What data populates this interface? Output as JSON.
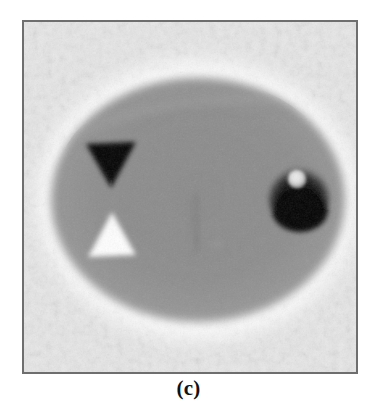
{
  "figure": {
    "caption": "(c)",
    "panel_label": "c",
    "kind": "grayscale-phantom-reconstruction"
  },
  "frame": {
    "border_color": "#6e6e6e",
    "border_width_px": 2,
    "x": 22,
    "y": 20,
    "width": 336,
    "height": 354
  },
  "image_content": {
    "background_label": "noisy-light-background",
    "background_color": "#ececec",
    "background_color_dark": "#d8d8d8",
    "halo_color": "#f7f7f7",
    "body": {
      "name": "ellipse-body",
      "center_x": 174,
      "center_y": 178,
      "radius_x": 147,
      "radius_y": 122,
      "fill_color": "#8c8c8c",
      "edge_color": "#9a9a9a"
    },
    "features": [
      {
        "name": "dark-triangle-down",
        "shape": "triangle",
        "orientation": "down",
        "center_x": 86,
        "center_y": 143,
        "width": 48,
        "height": 43,
        "fill_color": "#0d0d0d",
        "contrast": "dark"
      },
      {
        "name": "white-triangle-up",
        "shape": "triangle",
        "orientation": "up",
        "center_x": 88,
        "center_y": 212,
        "width": 46,
        "height": 42,
        "fill_color": "#fbfbfb",
        "contrast": "bright"
      },
      {
        "name": "dark-disc-lesion",
        "shape": "disc",
        "center_x": 275,
        "center_y": 176,
        "radius": 31,
        "fill_color": "#0a0a0a",
        "contrast": "dark"
      },
      {
        "name": "bright-spot-inclusion",
        "shape": "disc",
        "center_x": 273,
        "center_y": 157,
        "radius": 9,
        "fill_color": "#e6e6e6",
        "contrast": "bright"
      },
      {
        "name": "faint-vertical-streak",
        "shape": "streak",
        "center_x": 173,
        "center_y": 200,
        "width": 5,
        "height": 56,
        "fill_color": "#7e7e7e",
        "contrast": "subtle-dark"
      },
      {
        "name": "faint-diagonal-edge",
        "shape": "line",
        "start_x": 95,
        "start_y": 108,
        "end_x": 250,
        "end_y": 88,
        "fill_color": "#9b9b9b",
        "contrast": "subtle-bright"
      }
    ],
    "noise": {
      "type": "halftone-speckle",
      "amplitude": "moderate"
    }
  },
  "colors": {
    "page_background": "#ffffff",
    "caption_text": "#111111"
  }
}
